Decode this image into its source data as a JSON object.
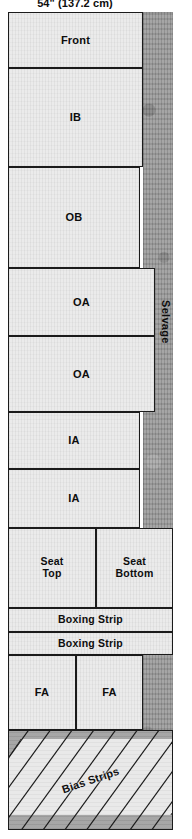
{
  "header": {
    "width_label": "54\" (137.2 cm)"
  },
  "fabric": {
    "selvage_caption": "Selvage",
    "selvage_band_name": "selvage-band"
  },
  "pieces": [
    {
      "id": "front",
      "label": "Front",
      "x": 0,
      "y": 0,
      "w": 135,
      "h": 56
    },
    {
      "id": "ib",
      "label": "IB",
      "x": 0,
      "y": 56,
      "w": 135,
      "h": 99
    },
    {
      "id": "ob",
      "label": "OB",
      "x": 0,
      "y": 155,
      "w": 132,
      "h": 101
    },
    {
      "id": "oa-1",
      "label": "OA",
      "x": 0,
      "y": 256,
      "w": 147,
      "h": 68
    },
    {
      "id": "oa-2",
      "label": "OA",
      "x": 0,
      "y": 324,
      "w": 147,
      "h": 76
    },
    {
      "id": "ia-1",
      "label": "IA",
      "x": 0,
      "y": 400,
      "w": 132,
      "h": 57
    },
    {
      "id": "ia-2",
      "label": "IA",
      "x": 0,
      "y": 457,
      "w": 132,
      "h": 59
    },
    {
      "id": "seat-top",
      "label": "Seat\nTop",
      "x": 0,
      "y": 516,
      "w": 88,
      "h": 80
    },
    {
      "id": "seat-bottom",
      "label": "Seat\nBottom",
      "x": 88,
      "y": 516,
      "w": 77,
      "h": 80
    },
    {
      "id": "boxing-1",
      "label": "Boxing Strip",
      "x": 0,
      "y": 596,
      "w": 165,
      "h": 24
    },
    {
      "id": "boxing-2",
      "label": "Boxing Strip",
      "x": 0,
      "y": 620,
      "w": 165,
      "h": 23
    },
    {
      "id": "fa-1",
      "label": "FA",
      "x": 0,
      "y": 643,
      "w": 68,
      "h": 75
    },
    {
      "id": "fa-2",
      "label": "FA",
      "x": 68,
      "y": 643,
      "w": 67,
      "h": 75
    }
  ],
  "bias": {
    "label": "Bias Strips"
  },
  "colors": {
    "cloth": "#ebebeb",
    "selvage": "#9b9b9b",
    "outline": "#1b1b1b",
    "text": "#0d0d0d",
    "bias_ground": "#a3a3a3"
  }
}
